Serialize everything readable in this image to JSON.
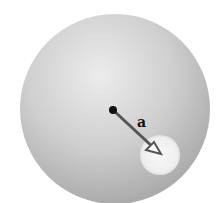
{
  "diagram": {
    "label_a": "a",
    "colors": {
      "sphere_light": "#ececec",
      "sphere_mid": "#cfcfcf",
      "sphere_dark": "#a9a9a9",
      "cavity": "#f4f4f4",
      "arrow": "#555555",
      "dot": "#111111"
    }
  }
}
